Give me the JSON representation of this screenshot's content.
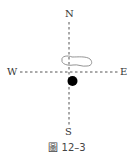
{
  "directions": {
    "north": "N",
    "south": "S",
    "east": "E",
    "west": "W"
  },
  "caption": "圖 12–3",
  "elements": {
    "cloud": "cloud-outline",
    "dot": "filled-black-circle"
  },
  "colors": {
    "line": "#555555",
    "dot": "#000000",
    "cloud": "#888888"
  }
}
